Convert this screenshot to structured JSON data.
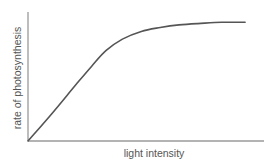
{
  "chart_data": {
    "type": "line",
    "title": "",
    "xlabel": "light intensity",
    "ylabel": "rate of photosynthesis",
    "grid": false,
    "legend": null,
    "x_ticks": [],
    "y_ticks": [],
    "xlim": [
      0,
      1
    ],
    "ylim": [
      0,
      1
    ],
    "series": [
      {
        "name": "rate of photosynthesis",
        "x": [
          0.0,
          0.1,
          0.2,
          0.27,
          0.33,
          0.4,
          0.48,
          0.56,
          0.64,
          0.72,
          0.82,
          0.92
        ],
        "y": [
          0.0,
          0.21,
          0.43,
          0.58,
          0.7,
          0.79,
          0.85,
          0.88,
          0.9,
          0.91,
          0.92,
          0.92
        ]
      }
    ]
  },
  "colors": {
    "axis": "#9a9a9a",
    "curve": "#555555",
    "text": "#555555"
  }
}
